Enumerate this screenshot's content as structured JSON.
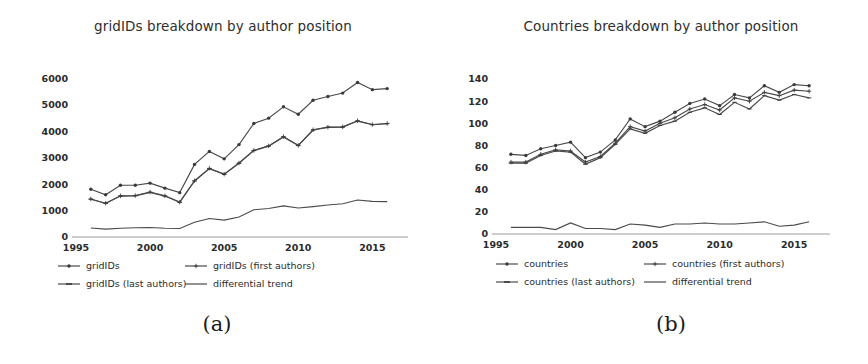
{
  "figure": {
    "background": "#ffffff",
    "line_color": "#4a4a4a",
    "text_color": "#2b2b2b",
    "axis_color": "#9a9a9a",
    "panels": [
      {
        "id": "a",
        "caption": "(a)"
      },
      {
        "id": "b",
        "caption": "(b)"
      }
    ]
  },
  "chart_data": [
    {
      "type": "line",
      "panel": "a",
      "caption": "(a)",
      "title": "gridIDs breakdown by author position",
      "xlabel": "",
      "ylabel": "",
      "grid": false,
      "legend_position": "below-axis",
      "xlim": [
        1995,
        2017
      ],
      "ylim": [
        0,
        6400
      ],
      "xticks": [
        1995,
        2000,
        2005,
        2010,
        2015
      ],
      "xticklabels": [
        "1995",
        "2000",
        "2005",
        "2010",
        "2015"
      ],
      "yticks": [
        0,
        1000,
        2000,
        3000,
        4000,
        5000,
        6000
      ],
      "yticklabels": [
        "0",
        "1000",
        "2000",
        "3000",
        "4000",
        "5000",
        "6000"
      ],
      "x": [
        1996,
        1997,
        1998,
        1999,
        2000,
        2001,
        2002,
        2003,
        2004,
        2005,
        2006,
        2007,
        2008,
        2009,
        2010,
        2011,
        2012,
        2013,
        2014,
        2015,
        2016
      ],
      "series": [
        {
          "name": "gridIDs",
          "marker": "dot",
          "values": [
            1810,
            1600,
            1960,
            1960,
            2040,
            1850,
            1680,
            2750,
            3240,
            2960,
            3500,
            4300,
            4500,
            4930,
            4650,
            5180,
            5320,
            5450,
            5850,
            5580,
            5620
          ]
        },
        {
          "name": "gridIDs (first authors)",
          "marker": "plus",
          "values": [
            1440,
            1280,
            1560,
            1570,
            1700,
            1560,
            1320,
            2130,
            2600,
            2380,
            2800,
            3280,
            3450,
            3800,
            3470,
            4060,
            4160,
            4170,
            4400,
            4260,
            4300
          ]
        },
        {
          "name": "gridIDs (last authors)",
          "marker": "dash",
          "values": [
            1430,
            1270,
            1550,
            1560,
            1690,
            1550,
            1310,
            2120,
            2590,
            2370,
            2790,
            3270,
            3440,
            3790,
            3460,
            4050,
            4150,
            4160,
            4390,
            4250,
            4290
          ]
        },
        {
          "name": "differential trend",
          "marker": "none",
          "values": [
            340,
            300,
            330,
            350,
            360,
            330,
            320,
            560,
            700,
            640,
            760,
            1030,
            1080,
            1180,
            1100,
            1150,
            1210,
            1260,
            1400,
            1350,
            1340
          ]
        }
      ],
      "legend": [
        {
          "label": "gridIDs",
          "style": "line-dot"
        },
        {
          "label": "gridIDs (first authors)",
          "style": "line-plus"
        },
        {
          "label": "gridIDs (last authors)",
          "style": "line-dash"
        },
        {
          "label": "differential trend",
          "style": "line-plain"
        }
      ]
    },
    {
      "type": "line",
      "panel": "b",
      "caption": "(b)",
      "title": "Countries breakdown by author position",
      "xlabel": "",
      "ylabel": "",
      "grid": false,
      "legend_position": "below-axis",
      "xlim": [
        1995,
        2017
      ],
      "ylim": [
        0,
        150
      ],
      "xticks": [
        1995,
        2000,
        2005,
        2010,
        2015
      ],
      "xticklabels": [
        "1995",
        "2000",
        "2005",
        "2010",
        "2015"
      ],
      "yticks": [
        0,
        20,
        40,
        60,
        80,
        100,
        120,
        140
      ],
      "yticklabels": [
        "0",
        "20",
        "40",
        "60",
        "80",
        "100",
        "120",
        "140"
      ],
      "x": [
        1996,
        1997,
        1998,
        1999,
        2000,
        2001,
        2002,
        2003,
        2004,
        2005,
        2006,
        2007,
        2008,
        2009,
        2010,
        2011,
        2012,
        2013,
        2014,
        2015,
        2016
      ],
      "series": [
        {
          "name": "countries",
          "marker": "dot",
          "values": [
            72,
            71,
            77,
            80,
            83,
            69,
            74,
            85,
            104,
            97,
            102,
            110,
            118,
            122,
            116,
            126,
            123,
            134,
            128,
            135,
            134
          ]
        },
        {
          "name": "countries (first authors)",
          "marker": "plus",
          "values": [
            65,
            65,
            72,
            76,
            75,
            65,
            70,
            82,
            97,
            93,
            100,
            105,
            113,
            117,
            112,
            123,
            120,
            128,
            125,
            130,
            129
          ]
        },
        {
          "name": "countries (last authors)",
          "marker": "dash",
          "values": [
            64,
            64,
            71,
            75,
            74,
            63,
            69,
            81,
            95,
            91,
            98,
            102,
            110,
            114,
            108,
            119,
            113,
            125,
            121,
            126,
            123
          ]
        },
        {
          "name": "differential trend",
          "marker": "none",
          "values": [
            6,
            6,
            6,
            4,
            10,
            5,
            5,
            4,
            9,
            8,
            6,
            9,
            9,
            10,
            9,
            9,
            10,
            11,
            7,
            8,
            11
          ]
        }
      ],
      "legend": [
        {
          "label": "countries",
          "style": "line-dot"
        },
        {
          "label": "countries (first authors)",
          "style": "line-plus"
        },
        {
          "label": "countries (last authors)",
          "style": "line-dash"
        },
        {
          "label": "differential trend",
          "style": "line-plain"
        }
      ]
    }
  ]
}
